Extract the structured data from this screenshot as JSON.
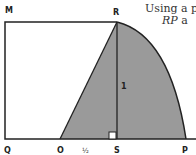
{
  "caption": {
    "line1": "Using a p",
    "line2_italic": "RP",
    "line2_rest": " a"
  },
  "labels": {
    "M": "M",
    "R": "R",
    "Q": "Q",
    "O": "O",
    "half": "½",
    "S": "S",
    "P": "P",
    "one": "1"
  },
  "colors": {
    "stroke": "#222222",
    "fill_shaded": "#9a9a9a",
    "background": "#ffffff"
  }
}
